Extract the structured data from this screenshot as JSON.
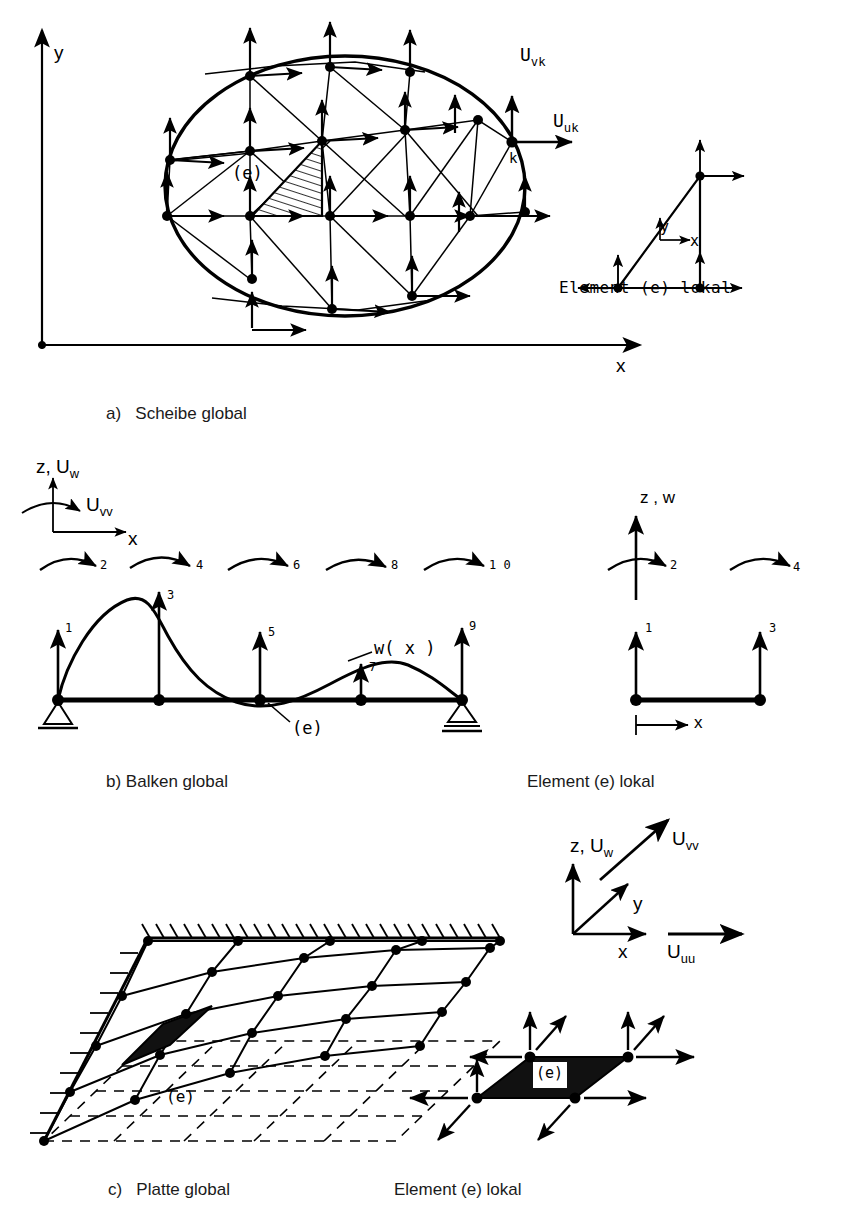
{
  "figure": {
    "ink_color": "#000000",
    "background": "#ffffff"
  },
  "panel_a": {
    "caption_marker": "a)",
    "caption_text": "Scheibe global",
    "axis_y": "y",
    "axis_x": "x",
    "node_label": "k",
    "element_label": "(e)",
    "dof_v": "U",
    "dof_v_sub": "vk",
    "dof_u": "U",
    "dof_u_sub": "uk",
    "local": {
      "caption": "Element (e) lokal",
      "axis_x": "x",
      "axis_y": "y"
    }
  },
  "panel_b": {
    "caption_marker": "b)",
    "caption_text": "Balken global",
    "axis_z": "z, U",
    "axis_z_sub": "w",
    "rot_dof": "U",
    "rot_dof_sub": "vv",
    "axis_x": "x",
    "element_label": "(e)",
    "deflection_label": "w( x )",
    "dof_numbers": [
      "1",
      "2",
      "3",
      "4",
      "5",
      "6",
      "7",
      "8",
      "9",
      "1 0"
    ],
    "local": {
      "caption": "Element (e) lokal",
      "axis_z": "z , w",
      "axis_x": "x",
      "dof_numbers": [
        "1",
        "2",
        "3",
        "4"
      ]
    }
  },
  "panel_c": {
    "caption_marker": "c)",
    "caption_text": "Platte global",
    "element_label": "(e)",
    "axes": {
      "z_label": "z, U",
      "z_sub": "w",
      "v_label": "U",
      "v_sub": "vv",
      "y_label": "y",
      "x_label": "x",
      "u_label": "U",
      "u_sub": "uu"
    },
    "local": {
      "caption": "Element (e) lokal",
      "element_label": "(e)"
    }
  }
}
